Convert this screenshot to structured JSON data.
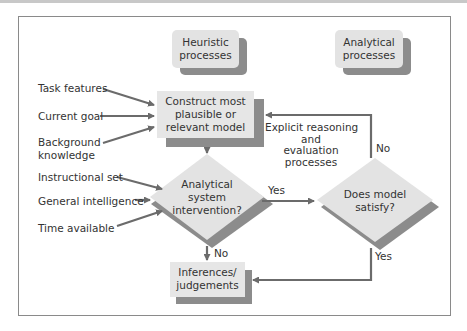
{
  "diagram": {
    "headers": {
      "heuristic": [
        "Heuristic",
        "processes"
      ],
      "analytical": [
        "Analytical",
        "processes"
      ]
    },
    "inputs_model": [
      "Task features",
      "Current goal",
      "Background",
      "knowledge"
    ],
    "inputs_intervention": [
      "Instructional set",
      "General intelligence",
      "Time available"
    ],
    "nodes": {
      "construct": [
        "Construct most",
        "plausible or",
        "relevant model"
      ],
      "intervention": [
        "Analytical",
        "system",
        "intervention?"
      ],
      "satisfy": [
        "Does model",
        "satisfy?"
      ],
      "inferences": [
        "Inferences/",
        "judgements"
      ]
    },
    "edge_labels": {
      "yes_intervention": "Yes",
      "no_intervention": "No",
      "no_satisfy": "No",
      "yes_satisfy": "Yes",
      "explicit": [
        "Explicit reasoning",
        "and",
        "evaluation",
        "processes"
      ]
    },
    "colors": {
      "box_fill": "#e6e6e6",
      "shadow": "#8c8c8c",
      "arrow": "#6b6b6b",
      "frame": "#8a8a8a"
    }
  }
}
